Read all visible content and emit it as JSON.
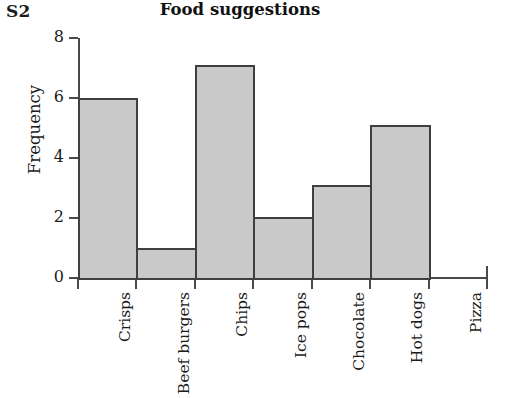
{
  "sheet_label": "S2",
  "chart_data": {
    "type": "bar",
    "title": "Food suggestions",
    "xlabel": "",
    "ylabel": "Frequency",
    "categories": [
      "Crisps",
      "Beef burgers",
      "Chips",
      "Ice pops",
      "Chocolate",
      "Hot dogs",
      "Pizza"
    ],
    "values": [
      6,
      1,
      7.1,
      2.05,
      3.1,
      5.1,
      0
    ],
    "ylim": [
      0,
      8
    ],
    "ytick_labels": [
      "0",
      "2",
      "4",
      "6",
      "8"
    ],
    "ytick_values": [
      0,
      2,
      4,
      6,
      8
    ],
    "grid": false,
    "legend": null,
    "bar_fill_color": "#c9c9c9",
    "bar_edge_color": "#3f3f3f",
    "axis_color": "#4a4a4a",
    "background_color": "#ffffff"
  }
}
